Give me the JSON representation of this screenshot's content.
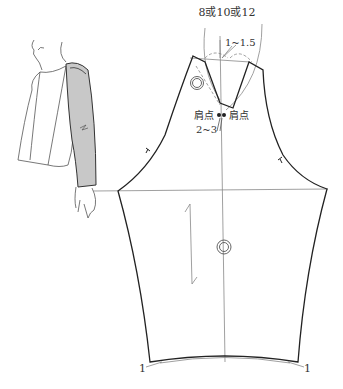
{
  "diagram": {
    "labels": {
      "top_measure": "8或10或12",
      "dart_measure": "1~1.5",
      "shoulder_point_left": "肩点",
      "shoulder_point_right": "肩点",
      "shoulder_gap": "2~3",
      "hem_left": "1",
      "hem_right": "1"
    },
    "colors": {
      "outline": "#222222",
      "guide": "#888888",
      "sleeve_fill": "#c8c8c8"
    },
    "figure": {
      "description": "Side view of woman wearing raglan-sleeve top, sleeve shaded gray"
    }
  }
}
